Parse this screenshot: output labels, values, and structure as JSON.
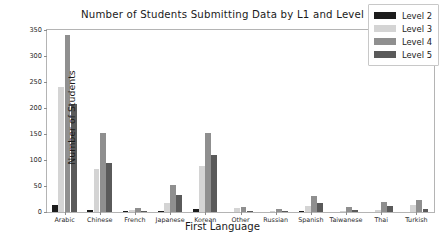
{
  "chart_data": {
    "type": "bar",
    "title": "Number of Students Submitting Data by L1 and Level",
    "xlabel": "First Language",
    "ylabel": "Number of Students",
    "categories": [
      "Arabic",
      "Chinese",
      "French",
      "Japanese",
      "Korean",
      "Other",
      "Russian",
      "Spanish",
      "Taiwanese",
      "Thai",
      "Turkish"
    ],
    "series": [
      {
        "name": "Level 2",
        "color": "#1c1c1c",
        "values": [
          13,
          3,
          1,
          1,
          5,
          0,
          0,
          1,
          0,
          0,
          0
        ]
      },
      {
        "name": "Level 3",
        "color": "#d4d4d4",
        "values": [
          240,
          82,
          4,
          18,
          88,
          8,
          2,
          12,
          2,
          3,
          13
        ]
      },
      {
        "name": "Level 4",
        "color": "#8f8f8f",
        "values": [
          340,
          152,
          7,
          51,
          152,
          10,
          5,
          30,
          9,
          19,
          24
        ]
      },
      {
        "name": "Level 5",
        "color": "#5a5a5a",
        "values": [
          208,
          95,
          2,
          33,
          110,
          2,
          1,
          17,
          3,
          11,
          5
        ]
      }
    ],
    "yticks": [
      0,
      50,
      100,
      150,
      200,
      250,
      300,
      350
    ],
    "ylim": [
      0,
      350
    ],
    "grid": false,
    "legend_position": "upper right"
  },
  "legend": {
    "entries": [
      {
        "label": "Level 2"
      },
      {
        "label": "Level 3"
      },
      {
        "label": "Level 4"
      },
      {
        "label": "Level 5"
      }
    ]
  },
  "colors": {
    "level_2": "#1c1c1c",
    "level_3": "#d4d4d4",
    "level_4": "#8f8f8f",
    "level_5": "#5a5a5a",
    "axis": "#b4b4b4",
    "text": "#1a1a1a",
    "background": "#ffffff"
  }
}
